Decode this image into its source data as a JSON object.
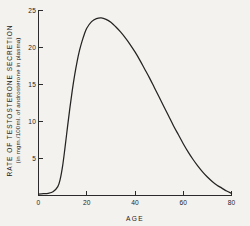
{
  "chart_data": {
    "type": "line",
    "title": "",
    "xlabel": "AGE",
    "ylabel_line1": "RATE  OF  TESTOSTERONE  SECRETION",
    "ylabel_line2": "(in mgm./100ml. of androsterone in plasma)",
    "xlim": [
      0,
      80
    ],
    "ylim": [
      0,
      25
    ],
    "xticks": [
      0,
      20,
      40,
      60,
      80
    ],
    "xtick_labels": [
      "0",
      "20",
      "40",
      "60",
      "80"
    ],
    "yticks": [
      5,
      10,
      15,
      20,
      25
    ],
    "ytick_labels": [
      "5",
      "10",
      "15",
      "20",
      "25"
    ],
    "grid": false,
    "legend": false,
    "series": [
      {
        "name": "Testosterone secretion rate",
        "x": [
          0,
          2,
          4,
          6,
          8,
          9,
          10,
          11,
          12,
          13,
          14,
          15,
          16,
          17,
          18,
          19,
          20,
          22,
          24,
          26,
          28,
          30,
          32,
          34,
          36,
          38,
          40,
          42,
          44,
          46,
          48,
          50,
          52,
          54,
          56,
          58,
          60,
          62,
          64,
          66,
          68,
          70,
          72,
          74,
          76,
          78,
          80
        ],
        "values": [
          0.2,
          0.25,
          0.3,
          0.5,
          1.2,
          2.2,
          4.0,
          6.5,
          9.2,
          11.8,
          14.2,
          16.3,
          18.1,
          19.6,
          20.8,
          21.8,
          22.6,
          23.5,
          23.9,
          24.0,
          23.8,
          23.4,
          22.8,
          22.1,
          21.3,
          20.4,
          19.4,
          18.3,
          17.1,
          15.9,
          14.6,
          13.3,
          12.0,
          10.7,
          9.4,
          8.2,
          7.0,
          5.9,
          4.9,
          4.0,
          3.2,
          2.5,
          1.9,
          1.4,
          1.0,
          0.6,
          0.3
        ]
      }
    ],
    "peak": {
      "x": 26,
      "y": 24.0
    },
    "colors": {
      "curve": "#242424",
      "axis": "#2b2b2b",
      "background": "#f4f2ee",
      "text": "#1c1c1c"
    }
  }
}
